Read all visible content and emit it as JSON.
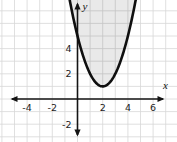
{
  "figure": {
    "background_color": "#ffffff",
    "grid_color": "#d8d8d8",
    "axis_color": "#141414",
    "curve_color": "#101010",
    "shade_color": "rgba(0,0,0,0.085)",
    "text_color": "#1c1c1c"
  },
  "chart_data": {
    "type": "line",
    "equation": "y = (x - 2)^2 + 1",
    "boundary_style": "solid",
    "shaded_region": "interior of parabola (above the curve)",
    "grid": true,
    "grid_unit": 1,
    "xlabel": "x",
    "ylabel": "y",
    "xlim": [
      -5.2,
      7.3
    ],
    "ylim": [
      -3.4,
      7.7
    ],
    "x_tick_values": [
      -4,
      -2,
      2,
      4,
      6
    ],
    "x_tick_labels": [
      "-4",
      "-2",
      "2",
      "4",
      "6"
    ],
    "y_tick_values": [
      4,
      2,
      -2
    ],
    "y_tick_labels": [
      "4",
      "2",
      "-2"
    ],
    "vertex": [
      2,
      1
    ],
    "y_intercept": [
      0,
      5
    ],
    "key_points": [
      [
        0,
        5
      ],
      [
        1,
        2
      ],
      [
        2,
        1
      ],
      [
        3,
        2
      ],
      [
        4,
        5
      ]
    ]
  }
}
